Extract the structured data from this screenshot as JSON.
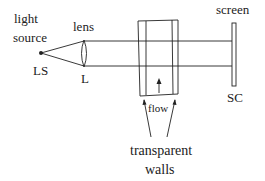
{
  "labels": {
    "light_source_line1": "light",
    "light_source_line2": "source",
    "ls": "LS",
    "lens": "lens",
    "l": "L",
    "screen": "screen",
    "sc": "SC",
    "flow": "flow",
    "walls_line1": "transparent",
    "walls_line2": "walls"
  },
  "colors": {
    "stroke": "#222222",
    "background": "#ffffff"
  }
}
